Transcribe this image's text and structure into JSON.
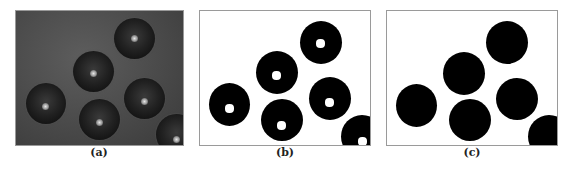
{
  "figure": {
    "panels": [
      {
        "id": "a",
        "label": "(a)",
        "description": "grayscale photograph of dark spherical particles"
      },
      {
        "id": "b",
        "label": "(b)",
        "description": "binarized image with white specular holes"
      },
      {
        "id": "c",
        "label": "(c)",
        "description": "filled binary masks of particles"
      }
    ],
    "particle_count": 6,
    "colors": {
      "background_a": "#4a4a4a",
      "particle": "#000000",
      "paper": "#ffffff"
    }
  }
}
